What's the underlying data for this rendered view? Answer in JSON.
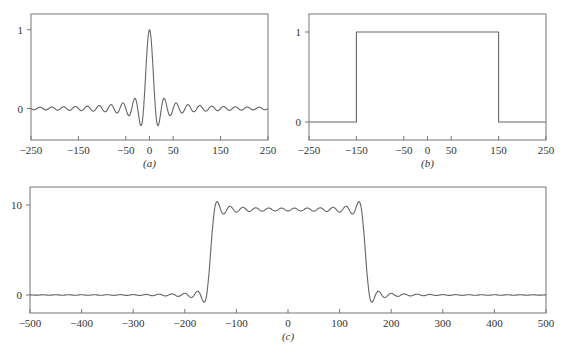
{
  "chart_data": [
    {
      "panel": "a",
      "type": "line",
      "caption": "(a)",
      "function": "sinc",
      "description": "Sinc function: peak 1 at x=0, zero crossings about every 12.5 units, decaying sidelobes (~-0.22 first minima)",
      "xlim": [
        -250,
        250
      ],
      "ylim": [
        -0.4,
        1.2
      ],
      "xticks": [
        -250,
        -150,
        -50,
        0,
        50,
        150,
        250
      ],
      "xtick_labels": [
        "−250",
        "−150",
        "−50",
        "0",
        "50",
        "150",
        "250"
      ],
      "yticks": [
        0,
        1
      ],
      "ytick_labels": [
        "0",
        "1"
      ],
      "params": {
        "zero_spacing": 12.5,
        "amplitude": 1
      },
      "key_points": {
        "x": [
          0,
          -14,
          14,
          -25,
          25
        ],
        "y": [
          1.0,
          -0.22,
          -0.22,
          0.13,
          0.13
        ]
      },
      "frame_px": {
        "left": 31,
        "right": 268,
        "top": 14,
        "bottom": 140
      },
      "grid": false
    },
    {
      "panel": "b",
      "type": "line",
      "caption": "(b)",
      "function": "rect",
      "description": "Rectangular pulse: value 1 for |x| < 150, 0 otherwise",
      "xlim": [
        -250,
        250
      ],
      "ylim": [
        -0.2,
        1.2
      ],
      "xticks": [
        -250,
        -150,
        -50,
        0,
        50,
        150,
        250
      ],
      "xtick_labels": [
        "−250",
        "−150",
        "−50",
        "0",
        "50",
        "150",
        "250"
      ],
      "yticks": [
        0,
        1
      ],
      "ytick_labels": [
        "0",
        "1"
      ],
      "params": {
        "half_width": 150,
        "amplitude": 1
      },
      "x": [
        -250,
        -150,
        -150,
        150,
        150,
        250
      ],
      "y": [
        0,
        0,
        1,
        1,
        0,
        0
      ],
      "frame_px": {
        "left": 309,
        "right": 546,
        "top": 14,
        "bottom": 140
      },
      "grid": false
    },
    {
      "panel": "c",
      "type": "line",
      "caption": "(c)",
      "function": "rect_convolved_with_sinc",
      "description": "Convolution of rect (half-width 150) with sinc: plateau ~9.5 with Gibbs ripple, overshoot ~10.4 near x=±140, undershoot ~-0.9 near x=±160",
      "xlim": [
        -500,
        500
      ],
      "ylim": [
        -2,
        12
      ],
      "xticks": [
        -500,
        -400,
        -300,
        -200,
        -100,
        0,
        100,
        200,
        300,
        400,
        500
      ],
      "xtick_labels": [
        "−500",
        "−400",
        "−300",
        "−200",
        "−100",
        "0",
        "100",
        "200",
        "300",
        "400",
        "500"
      ],
      "yticks": [
        0,
        10
      ],
      "ytick_labels": [
        "0",
        "10"
      ],
      "params": {
        "half_width": 150,
        "zero_spacing": 12.5,
        "plateau": 9.5
      },
      "key_points": {
        "x": [
          -160,
          -140,
          0,
          140,
          160
        ],
        "y": [
          -0.9,
          10.4,
          9.5,
          10.4,
          -0.9
        ]
      },
      "frame_px": {
        "left": 30,
        "right": 546,
        "top": 187,
        "bottom": 313
      },
      "grid": false
    }
  ]
}
